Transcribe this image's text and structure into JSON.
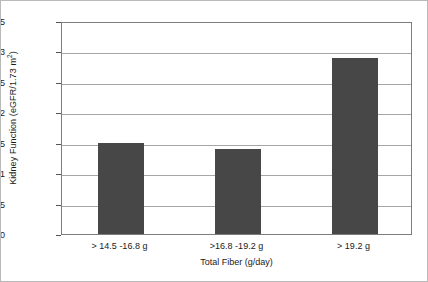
{
  "chart_data": {
    "type": "bar",
    "title": "",
    "subtitle": "",
    "categories": [
      "> 14.5 -16.8 g",
      ">16.8 -19.2 g",
      "> 19.2 g"
    ],
    "values": [
      1.5,
      1.4,
      2.9
    ],
    "xlabel": "Total Fiber (g/day)",
    "ylabel_text": "Kidney Function (eGFR/1.73 m",
    "ylabel_sup": "2",
    "ylabel_tail": ")",
    "ylim": [
      0,
      3.5
    ],
    "yticks": [
      "0",
      "0.5",
      "1",
      "1.5",
      "2",
      "2.5",
      "3",
      "3.5"
    ],
    "ytick_values": [
      0,
      0.5,
      1,
      1.5,
      2,
      2.5,
      3,
      3.5
    ],
    "grid": true,
    "legend": "none",
    "bar_color": "#474747",
    "grid_color": "#a6a6a6",
    "axis_color": "#7d7d7d",
    "background": "#ffffff"
  }
}
